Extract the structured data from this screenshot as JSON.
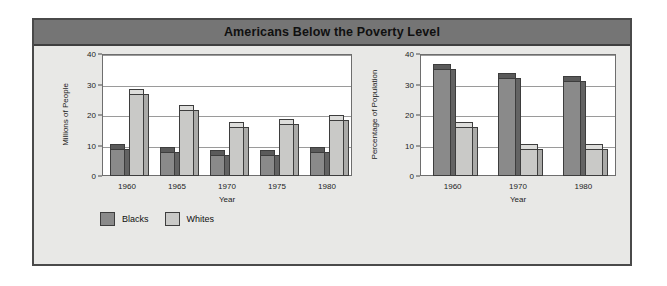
{
  "panel": {
    "title": "Americans Below the Poverty Level",
    "colors": {
      "panel_background": "#e8e8e6",
      "title_bar": "#757575",
      "border": "#4a4a4a",
      "plot_background": "#ffffff",
      "gridline": "#9a9a9a",
      "blacks_bar": "#8a8a8a",
      "whites_bar": "#c9c9c7"
    }
  },
  "legend": {
    "items": [
      {
        "label": "Blacks",
        "color": "#8a8a8a",
        "key": "blacks"
      },
      {
        "label": "Whites",
        "color": "#c9c9c7",
        "key": "whites"
      }
    ]
  },
  "chart_data": [
    {
      "id": "millions",
      "type": "bar",
      "title": "",
      "xlabel": "Year",
      "ylabel": "Millions of People",
      "ylim": [
        0,
        40
      ],
      "yticks": [
        0,
        10,
        20,
        30,
        40
      ],
      "grid": true,
      "legend_position": "below",
      "categories": [
        "1960",
        "1965",
        "1970",
        "1975",
        "1980"
      ],
      "series": [
        {
          "name": "Blacks",
          "values": [
            9,
            8,
            7,
            7,
            8
          ]
        },
        {
          "name": "Whites",
          "values": [
            27,
            21.5,
            16,
            17,
            18.5
          ]
        }
      ]
    },
    {
      "id": "percentage",
      "type": "bar",
      "title": "",
      "xlabel": "Year",
      "ylabel": "Percentage of Population",
      "ylim": [
        0,
        40
      ],
      "yticks": [
        0,
        10,
        20,
        30,
        40
      ],
      "grid": true,
      "legend_position": "below",
      "categories": [
        "1960",
        "1970",
        "1980"
      ],
      "series": [
        {
          "name": "Blacks",
          "values": [
            35,
            32,
            31
          ]
        },
        {
          "name": "Whites",
          "values": [
            16,
            9,
            9
          ]
        }
      ]
    }
  ]
}
